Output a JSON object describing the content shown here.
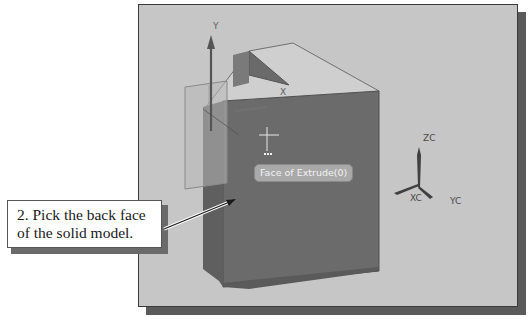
{
  "viewport": {
    "background_color": "#c6c6c6",
    "body_color": "#6b6b6b"
  },
  "csys": {
    "y_label": "Y",
    "x_label": "X"
  },
  "triad": {
    "zc_label": "ZC",
    "xc_label": "XC",
    "yc_label": "YC"
  },
  "tooltip": {
    "text": "Face of Extrude(0)"
  },
  "callout": {
    "line1": "2. Pick the back face",
    "line2": "of the solid model."
  }
}
